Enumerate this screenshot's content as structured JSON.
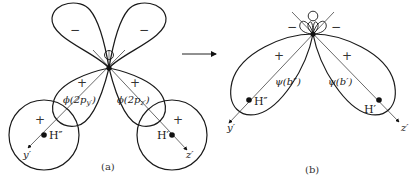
{
  "figure": {
    "panel_a": {
      "caption": "(a)",
      "signs": {
        "upper_left_lobe": "−",
        "upper_right_lobe": "−",
        "lower_left_lobe": "+",
        "lower_right_lobe": "+",
        "left_sphere": "+",
        "right_sphere": "+"
      },
      "orbital_left": {
        "prefix": "ϕ(2p",
        "subscript": "y′",
        "suffix": ")"
      },
      "orbital_right": {
        "prefix": "ϕ(2p",
        "subscript": "z′",
        "suffix": ")"
      },
      "atom_left": "H″",
      "atom_right": "H′",
      "axis_left": "y′",
      "axis_right": "z′"
    },
    "panel_b": {
      "caption": "(b)",
      "signs": {
        "small_left": "−",
        "small_right": "−",
        "left_lobe": "+",
        "right_lobe": "+"
      },
      "orbital_left": "ψ(b″)",
      "orbital_right": "ψ(b′)",
      "atom_left": "H″",
      "atom_right": "H′",
      "axis_left": "y′",
      "axis_right": "z′"
    },
    "transition_arrow": "→"
  }
}
